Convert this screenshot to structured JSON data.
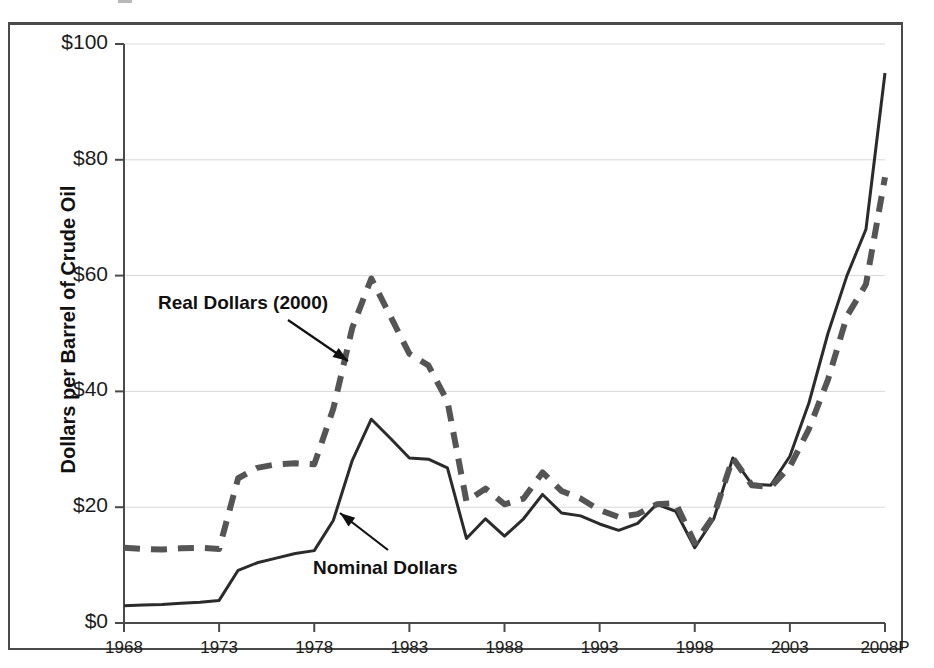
{
  "figure": {
    "background": "#ffffff",
    "frame_color": "#4a4a4a"
  },
  "axes": {
    "y_title": "Dollars per Barrel of Crude Oil",
    "y_ticks": [
      "$0",
      "$20",
      "$40",
      "$60",
      "$80",
      "$100"
    ],
    "x_ticks": [
      "1968",
      "1973",
      "1978",
      "1983",
      "1988",
      "1993",
      "1998",
      "2003",
      "2008P"
    ]
  },
  "annotations": {
    "real": "Real Dollars (2000)",
    "nominal": "Nominal Dollars"
  },
  "colors": {
    "nominal_line": "#2b2b2b",
    "real_line": "#555555",
    "gridline": "#d8d8d8",
    "axis": "#4a4a4a",
    "text": "#111111"
  },
  "chart_data": {
    "type": "line",
    "title": "",
    "subtitle": "",
    "xlabel": "",
    "ylabel": "Dollars per Barrel of Crude Oil",
    "xlim": [
      1968,
      2008
    ],
    "ylim": [
      0,
      100
    ],
    "grid": true,
    "legend": "annotated-inline",
    "x_tick_labels": [
      "1968",
      "1973",
      "1978",
      "1983",
      "1988",
      "1993",
      "1998",
      "2003",
      "2008P"
    ],
    "x_tick_values": [
      1968,
      1973,
      1978,
      1983,
      1988,
      1993,
      1998,
      2003,
      2008
    ],
    "y_tick_labels": [
      "$0",
      "$20",
      "$40",
      "$60",
      "$80",
      "$100"
    ],
    "y_tick_values": [
      0,
      20,
      40,
      60,
      80,
      100
    ],
    "x": [
      1968,
      1969,
      1970,
      1971,
      1972,
      1973,
      1974,
      1975,
      1976,
      1977,
      1978,
      1979,
      1980,
      1981,
      1982,
      1983,
      1984,
      1985,
      1986,
      1987,
      1988,
      1989,
      1990,
      1991,
      1992,
      1993,
      1994,
      1995,
      1996,
      1997,
      1998,
      1999,
      2000,
      2001,
      2002,
      2003,
      2004,
      2005,
      2006,
      2007,
      2008
    ],
    "series": [
      {
        "name": "Nominal Dollars",
        "style": "solid",
        "color": "#2b2b2b",
        "values": [
          3.0,
          3.1,
          3.2,
          3.4,
          3.6,
          3.9,
          9.1,
          10.4,
          11.2,
          12.0,
          12.5,
          17.7,
          28.1,
          35.2,
          31.9,
          28.5,
          28.3,
          26.8,
          14.6,
          18.0,
          15.0,
          18.0,
          22.2,
          19.0,
          18.5,
          17.1,
          16.0,
          17.2,
          20.5,
          19.3,
          13.0,
          18.0,
          28.5,
          24.0,
          23.8,
          28.8,
          38.0,
          50.0,
          60.0,
          68.0,
          95.0
        ]
      },
      {
        "name": "Real Dollars (2000)",
        "style": "dashed",
        "color": "#555555",
        "values": [
          13.0,
          12.8,
          12.7,
          12.9,
          13.0,
          12.8,
          25.0,
          26.8,
          27.4,
          27.6,
          27.4,
          37.0,
          51.0,
          59.5,
          53.0,
          46.5,
          44.5,
          38.3,
          21.0,
          23.2,
          20.5,
          21.5,
          26.0,
          22.8,
          21.5,
          19.5,
          18.3,
          18.8,
          20.5,
          20.7,
          13.8,
          18.5,
          28.5,
          23.8,
          23.5,
          27.0,
          33.5,
          42.0,
          53.0,
          58.5,
          77.0
        ]
      }
    ],
    "annotations": [
      {
        "text": "Real Dollars (2000)",
        "points_to_year": 1980,
        "points_to_value": 47.0
      },
      {
        "text": "Nominal Dollars",
        "points_to_year": 1978,
        "points_to_value": 16.5
      }
    ]
  }
}
